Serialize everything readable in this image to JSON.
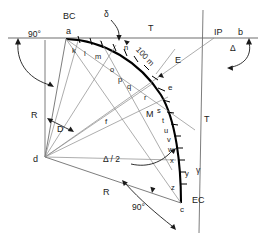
{
  "figure": {
    "colors": {
      "curve": "#000000",
      "line": "#555555",
      "tangent": "#6e6e6e",
      "text": "#1a1a1a",
      "background": "#ffffff"
    }
  },
  "points": [
    {
      "id": "bc",
      "label": "BC",
      "x": 63,
      "y": 12
    },
    {
      "id": "a",
      "label": "a",
      "x": 66,
      "y": 27
    },
    {
      "id": "ip",
      "label": "IP",
      "x": 214,
      "y": 28
    },
    {
      "id": "b",
      "label": "b",
      "x": 238,
      "y": 28
    },
    {
      "id": "d",
      "label": "d",
      "x": 33,
      "y": 155
    },
    {
      "id": "ec",
      "label": "EC",
      "x": 192,
      "y": 196
    },
    {
      "id": "c",
      "label": "c",
      "x": 180,
      "y": 206
    },
    {
      "id": "e",
      "label": "e",
      "x": 168,
      "y": 84
    },
    {
      "id": "f",
      "label": "f",
      "x": 105,
      "y": 118
    }
  ],
  "station_ticks": {
    "upper": [
      "k",
      "l",
      "m",
      "n",
      "o",
      "p",
      "q",
      "r"
    ],
    "lower": [
      "s",
      "t",
      "u",
      "v",
      "w",
      "x",
      "y",
      "z"
    ],
    "upper_positions": [
      {
        "label": "k",
        "x": 72,
        "y": 47
      },
      {
        "label": "l",
        "x": 84,
        "y": 50
      },
      {
        "label": "m",
        "x": 95,
        "y": 53
      },
      {
        "label": "n",
        "x": 124,
        "y": 44
      },
      {
        "label": "o",
        "x": 110,
        "y": 66
      },
      {
        "label": "p",
        "x": 118,
        "y": 76
      },
      {
        "label": "q",
        "x": 127,
        "y": 83
      },
      {
        "label": "r",
        "x": 144,
        "y": 94
      }
    ],
    "lower_positions": [
      {
        "label": "s",
        "x": 157,
        "y": 107
      },
      {
        "label": "t",
        "x": 162,
        "y": 117
      },
      {
        "label": "u",
        "x": 164,
        "y": 127
      },
      {
        "label": "v",
        "x": 167,
        "y": 136
      },
      {
        "label": "w",
        "x": 168,
        "y": 146
      },
      {
        "label": "x",
        "x": 170,
        "y": 157
      },
      {
        "label": "y",
        "x": 185,
        "y": 170
      },
      {
        "label": "z",
        "x": 171,
        "y": 184
      }
    ]
  },
  "labels": {
    "tangent_top": "T",
    "tangent_right": "T",
    "external": "E",
    "middle_ordinate": "M",
    "radius_left": "R",
    "radius_lower": "R",
    "chord_length": "100 m",
    "delta_small": "δ",
    "delta_big": "Δ",
    "delta_half": "Δ / 2",
    "gamma": "γ",
    "angle_d": "D",
    "right_angle_top": "90°",
    "right_angle_bottom": "90°"
  },
  "label_positions": {
    "tangent_top": {
      "x": 148,
      "y": 24
    },
    "tangent_right": {
      "x": 204,
      "y": 115
    },
    "external": {
      "x": 175,
      "y": 56
    },
    "middle_ordinate": {
      "x": 146,
      "y": 110
    },
    "radius_left": {
      "x": 31,
      "y": 111
    },
    "radius_lower": {
      "x": 103,
      "y": 188
    },
    "chord_length": {
      "x": 140,
      "y": 46
    },
    "delta_small": {
      "x": 104,
      "y": 10
    },
    "delta_big": {
      "x": 230,
      "y": 44
    },
    "delta_half": {
      "x": 103,
      "y": 155
    },
    "gamma": {
      "x": 196,
      "y": 166
    },
    "angle_d": {
      "x": 57,
      "y": 125
    },
    "right_angle_top": {
      "x": 28,
      "y": 30
    },
    "right_angle_bottom": {
      "x": 132,
      "y": 203
    }
  }
}
